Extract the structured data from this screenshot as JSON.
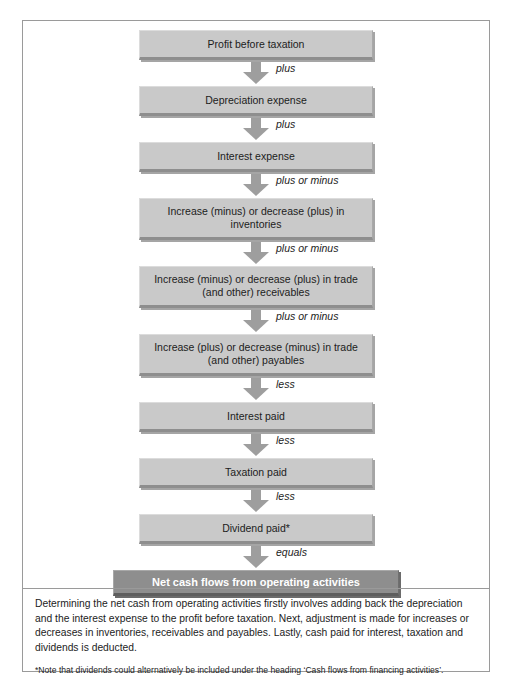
{
  "scan_sliver_text": "",
  "figure": {
    "nodes": [
      {
        "id": "profit-before-taxation",
        "label": "Profit before taxation",
        "lines": 1,
        "style": "normal"
      },
      {
        "id": "depreciation-expense",
        "label": "Depreciation expense",
        "lines": 1,
        "style": "normal"
      },
      {
        "id": "interest-expense",
        "label": "Interest expense",
        "lines": 1,
        "style": "normal"
      },
      {
        "id": "inventories-change",
        "label": "Increase (minus) or decrease (plus) in inventories",
        "lines": 2,
        "style": "normal"
      },
      {
        "id": "receivables-change",
        "label": "Increase (minus) or decrease (plus) in trade (and other) receivables",
        "lines": 2,
        "style": "normal"
      },
      {
        "id": "payables-change",
        "label": "Increase (plus) or decrease (minus) in trade (and other) payables",
        "lines": 2,
        "style": "normal"
      },
      {
        "id": "interest-paid",
        "label": "Interest paid",
        "lines": 1,
        "style": "normal"
      },
      {
        "id": "taxation-paid",
        "label": "Taxation paid",
        "lines": 1,
        "style": "normal"
      },
      {
        "id": "dividend-paid",
        "label": "Dividend paid*",
        "lines": 1,
        "style": "normal"
      },
      {
        "id": "net-cash-flows",
        "label": "Net cash flows from operating activities",
        "lines": 1,
        "style": "final"
      }
    ],
    "connectors": [
      {
        "id": "connector-1",
        "operator": "plus"
      },
      {
        "id": "connector-2",
        "operator": "plus"
      },
      {
        "id": "connector-3",
        "operator": "plus or minus"
      },
      {
        "id": "connector-4",
        "operator": "plus or minus"
      },
      {
        "id": "connector-5",
        "operator": "plus or minus"
      },
      {
        "id": "connector-6",
        "operator": "less"
      },
      {
        "id": "connector-7",
        "operator": "less"
      },
      {
        "id": "connector-8",
        "operator": "less"
      },
      {
        "id": "connector-9",
        "operator": "equals"
      }
    ]
  },
  "caption": {
    "body": "Determining the net cash from operating activities firstly involves adding back the depreciation and the interest expense to the profit before taxation. Next, adjustment is made for increases or decreases in inventories, receivables and payables. Lastly, cash paid for interest, taxation and dividends is deducted.",
    "note": "*Note that dividends could alternatively be included under the heading ‘Cash flows from financing activities’."
  },
  "colors": {
    "box_fill": "#c9c9c9",
    "box_shadow": "#a5a5a5",
    "final_box_fill": "#8e8e8e",
    "final_box_text": "#ffffff",
    "arrow_fill": "#9e9e9e",
    "frame_border": "#9a9a9a",
    "text": "#1c1c1c",
    "page_background": "#ffffff"
  }
}
